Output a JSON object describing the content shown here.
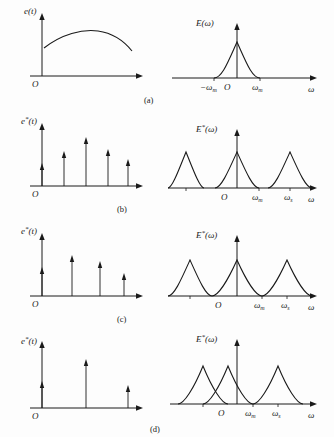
{
  "figure": {
    "background_color": "#fdfdfd",
    "ink_color": "#1a1a1a"
  },
  "symbols": {
    "omega": "ω",
    "minus_omega": "−ω",
    "star": "*",
    "origin": "O",
    "sub_m": "m",
    "sub_s": "s"
  },
  "rows": [
    {
      "tag": "(a)",
      "left": {
        "ylabel_base": "e",
        "ylabel_star": "",
        "ylabel_arg": "(t)",
        "origin": "O",
        "kind": "continuous-signal",
        "impulses": []
      },
      "right": {
        "ylabel_base": "E",
        "ylabel_star": "",
        "ylabel_arg": "(ω)",
        "origin": "O",
        "xlabel": "ω",
        "ticks": [
          {
            "label_base": "−ω",
            "label_sub": "m"
          },
          {
            "label_base": "ω",
            "label_sub": "m"
          }
        ],
        "kind": "single-lobe",
        "lobes": 1
      }
    },
    {
      "tag": "(b)",
      "left": {
        "ylabel_base": "e",
        "ylabel_star": "*",
        "ylabel_arg": "(t)",
        "origin": "O",
        "kind": "impulse-train",
        "impulse_count": 5,
        "impulse_heights": [
          18,
          30,
          44,
          32,
          22
        ]
      },
      "right": {
        "ylabel_base": "E",
        "ylabel_star": "*",
        "ylabel_arg": "(ω)",
        "origin": "O",
        "xlabel": "ω",
        "ticks": [
          {
            "label_base": "ω",
            "label_sub": "m"
          },
          {
            "label_base": "ω",
            "label_sub": "s"
          }
        ],
        "kind": "separated-lobes",
        "lobes": 3,
        "overlap": "none"
      }
    },
    {
      "tag": "(c)",
      "left": {
        "ylabel_base": "e",
        "ylabel_star": "*",
        "ylabel_arg": "(t)",
        "origin": "O",
        "kind": "impulse-train",
        "impulse_count": 4,
        "impulse_heights": [
          24,
          36,
          30,
          18
        ]
      },
      "right": {
        "ylabel_base": "E",
        "ylabel_star": "*",
        "ylabel_arg": "(ω)",
        "origin": "O",
        "xlabel": "ω",
        "ticks": [
          {
            "label_base": "ω",
            "label_sub": "m"
          },
          {
            "label_base": "ω",
            "label_sub": "s"
          }
        ],
        "kind": "touching-lobes",
        "lobes": 3,
        "overlap": "critical"
      }
    },
    {
      "tag": "(d)",
      "left": {
        "ylabel_base": "e",
        "ylabel_star": "*",
        "ylabel_arg": "(t)",
        "origin": "O",
        "kind": "impulse-train",
        "impulse_count": 3,
        "impulse_heights": [
          22,
          44,
          18
        ]
      },
      "right": {
        "ylabel_base": "E",
        "ylabel_star": "*",
        "ylabel_arg": "(ω)",
        "origin": "O",
        "xlabel": "ω",
        "ticks": [
          {
            "label_base": "ω",
            "label_sub": "m"
          },
          {
            "label_base": "ω",
            "label_sub": "s"
          }
        ],
        "kind": "overlapping-lobes",
        "lobes": 3,
        "overlap": "aliasing"
      }
    }
  ]
}
